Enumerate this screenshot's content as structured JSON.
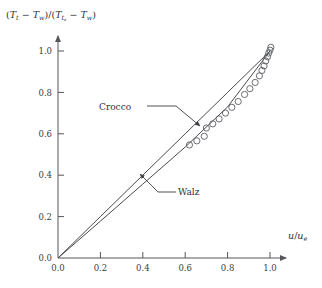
{
  "chart_data": {
    "type": "scatter",
    "title": "",
    "subtitle": "",
    "xlabel": "u/u_e",
    "ylabel": "(T_t - T_w)/(T_te - T_w)",
    "xlim": [
      0.0,
      1.05
    ],
    "ylim": [
      0.0,
      1.08
    ],
    "grid": false,
    "legend_position": "inline-annotations",
    "xticks": [
      "0.0",
      "0.2",
      "0.4",
      "0.6",
      "0.8",
      "1.0"
    ],
    "xtick_values": [
      0.0,
      0.2,
      0.4,
      0.6,
      0.8,
      1.0
    ],
    "yticks": [
      "0.2",
      "0.4",
      "0.6",
      "0.8",
      "1.0"
    ],
    "ytick_values": [
      0.2,
      0.4,
      0.6,
      0.8,
      1.0
    ],
    "origin_label": "0.0",
    "series": [
      {
        "name": "Crocco",
        "type": "line",
        "x": [
          0.0,
          0.2,
          0.4,
          0.6,
          0.8,
          1.0
        ],
        "values": [
          0.0,
          0.2,
          0.4,
          0.6,
          0.8,
          1.0
        ]
      },
      {
        "name": "Walz",
        "type": "line",
        "x": [
          0.0,
          0.2,
          0.4,
          0.6,
          0.8,
          1.0
        ],
        "values": [
          0.0,
          0.178,
          0.357,
          0.536,
          0.73,
          1.0
        ]
      },
      {
        "name": "measured data",
        "type": "scatter",
        "marker": "open-circle",
        "x": [
          0.62,
          0.655,
          0.69,
          0.7,
          0.73,
          0.76,
          0.79,
          0.82,
          0.85,
          0.88,
          0.905,
          0.93,
          0.95,
          0.962,
          0.972,
          0.98,
          0.988,
          0.994,
          1.0,
          1.004
        ],
        "values": [
          0.546,
          0.566,
          0.588,
          0.628,
          0.648,
          0.672,
          0.7,
          0.728,
          0.756,
          0.79,
          0.818,
          0.848,
          0.88,
          0.906,
          0.928,
          0.952,
          0.972,
          0.99,
          1.004,
          1.018
        ]
      }
    ]
  },
  "axes": {
    "ylabel_parts": {
      "open1": "(",
      "t1": "T",
      "t1sub": "t",
      "minus1": " − ",
      "t2": "T",
      "t2sub": "w",
      "close1": ")/(",
      "t3": "T",
      "t3sub": "t",
      "t3subsub": "e",
      "minus2": " − ",
      "t4": "T",
      "t4sub": "w",
      "close2": ")"
    },
    "xlabel_parts": {
      "u1": "u",
      "slash": "/",
      "u2": "u",
      "u2sub": "e"
    }
  },
  "annotations": {
    "crocco": "Crocco",
    "walz": "Walz"
  },
  "colors": {
    "axis": "#55565a",
    "curve": "#4a4b4f",
    "marker": "#5b5c60",
    "text": "#2f3034"
  }
}
